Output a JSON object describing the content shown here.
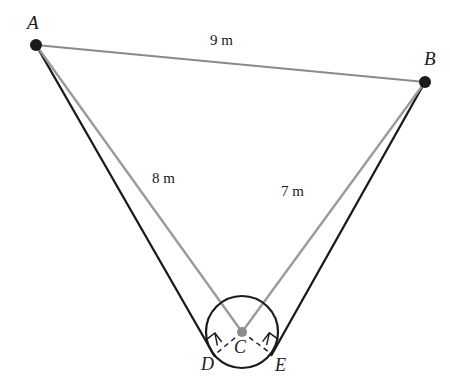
{
  "figure": {
    "type": "geometry-diagram",
    "colors": {
      "background": "#ffffff",
      "gray_segment": "#8a8a8a",
      "light_gray_segment": "#9b9b9b",
      "dark_segment": "#1a1a1a",
      "circle_stroke": "#1a1a1a",
      "center_dot": "#8e8e8e",
      "vertex_dot": "#1a1a1a",
      "text": "#1a1a1a"
    }
  },
  "vertices": [
    {
      "id": "A",
      "label": "A",
      "x": 36,
      "y": 45,
      "dot": true,
      "dot_color": "#1a1a1a",
      "dot_radius": 6
    },
    {
      "id": "B",
      "label": "B",
      "x": 425,
      "y": 82,
      "dot": true,
      "dot_color": "#1a1a1a",
      "dot_radius": 6
    },
    {
      "id": "C",
      "label": "C",
      "x": 242,
      "y": 332,
      "dot": true,
      "dot_color": "#8e8e8e",
      "dot_radius": 5
    },
    {
      "id": "D",
      "label": "D",
      "x": 214,
      "y": 355,
      "dot": false,
      "dot_color": "#1a1a1a",
      "dot_radius": 0
    },
    {
      "id": "E",
      "label": "E",
      "x": 272,
      "y": 354,
      "dot": false,
      "dot_color": "#1a1a1a",
      "dot_radius": 0
    }
  ],
  "segments": [
    {
      "id": "AB",
      "from": "A",
      "to": "B",
      "label": "9 m",
      "color": "#8a8a8a",
      "width": 2.2,
      "style": "solid"
    },
    {
      "id": "AC",
      "from": "A",
      "to": "C",
      "label": "8 m",
      "color": "#9b9b9b",
      "width": 2.4,
      "style": "solid"
    },
    {
      "id": "BC",
      "from": "B",
      "to": "C",
      "label": "7 m",
      "color": "#9b9b9b",
      "width": 2.4,
      "style": "solid"
    },
    {
      "id": "AD",
      "from": "A",
      "to": "D",
      "label": "",
      "color": "#1a1a1a",
      "width": 2.3,
      "style": "solid"
    },
    {
      "id": "BE",
      "from": "B",
      "to": "E",
      "label": "",
      "color": "#1a1a1a",
      "width": 2.3,
      "style": "solid"
    },
    {
      "id": "CD",
      "from": "C",
      "to": "D",
      "label": "",
      "color": "#1a1a1a",
      "width": 1.5,
      "style": "dashed"
    },
    {
      "id": "CE",
      "from": "C",
      "to": "E",
      "label": "",
      "color": "#1a1a1a",
      "width": 1.5,
      "style": "dashed"
    }
  ],
  "circle": {
    "id": "circle-C",
    "center_x": 242,
    "center_y": 332,
    "radius": 36,
    "stroke": "#1a1a1a",
    "stroke_width": 2.2,
    "fill": "none"
  },
  "right_angle_markers": [
    {
      "at": "D",
      "label": "right-angle-marker-D"
    },
    {
      "at": "E",
      "label": "right-angle-marker-E"
    }
  ],
  "labels": {
    "A": "A",
    "B": "B",
    "C": "C",
    "D": "D",
    "E": "E",
    "AB_length": "9 m",
    "AC_length": "8 m",
    "BC_length": "7 m"
  }
}
